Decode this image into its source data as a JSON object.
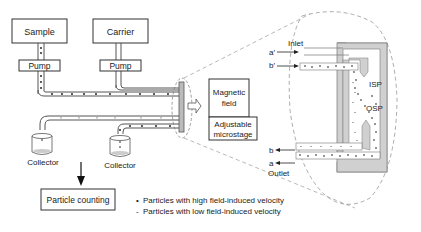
{
  "boxes": {
    "sample": "Sample",
    "carrier": "Carrier",
    "pump_left": "Pump",
    "pump_right": "Pump",
    "magnetic_line1": "Magnetic",
    "magnetic_line2": "field",
    "microstage_line1": "Adjustable",
    "microstage_line2": "microstage",
    "particle_counting": "Particle counting"
  },
  "collectors": [
    "Collector",
    "Collector"
  ],
  "detail": {
    "inlet": "Inlet",
    "outlet": "Outlet",
    "a_prime": "a′",
    "b_prime": "b′",
    "a": "a",
    "b": "b",
    "isp": "ISP",
    "osp": "OSP"
  },
  "legend": [
    {
      "marker": "•",
      "text": "Particles with high field-induced velocity"
    },
    {
      "marker": "-",
      "text": "Particles with low field-induced velocity"
    }
  ],
  "colors": {
    "line": "#444444",
    "channel_wall": "#c8c8c8",
    "dot": "#111111",
    "light_dot": "#999999"
  }
}
